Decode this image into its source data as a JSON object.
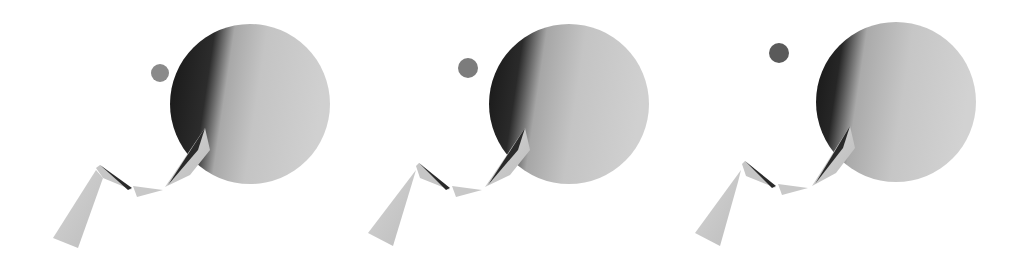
{
  "scene": {
    "description": "Three rendered frames of a 3D scene: large shaded sphere, small dark ball, and a chain of cones",
    "background": "#ffffff",
    "panels": [
      {
        "sphere": {
          "cx": 250,
          "cy": 105,
          "r": 80
        },
        "ball": {
          "cx": 160,
          "cy": 73,
          "r": 9,
          "color": "#8a8a8a"
        },
        "offset": 0
      },
      {
        "sphere": {
          "cx": 570,
          "cy": 105,
          "r": 80
        },
        "ball": {
          "cx": 468,
          "cy": 68,
          "r": 10,
          "color": "#7c7c7c"
        },
        "offset": 320
      },
      {
        "sphere": {
          "cx": 896,
          "cy": 102,
          "r": 80
        },
        "ball": {
          "cx": 779,
          "cy": 53,
          "r": 10,
          "color": "#5a5a5a"
        },
        "offset": 645
      }
    ],
    "colors": {
      "sphere_light": "#cfcfcf",
      "sphere_dark": "#1e1e1e",
      "cone": "#c8c8c8",
      "cone_dark": "#2a2a2a"
    }
  }
}
